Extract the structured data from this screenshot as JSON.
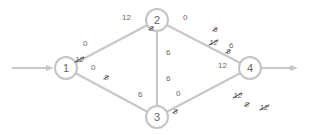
{
  "diagram": {
    "type": "flow-network",
    "nodes": [
      {
        "id": "1",
        "label": "1",
        "x": 66,
        "y": 68
      },
      {
        "id": "2",
        "label": "2",
        "x": 157,
        "y": 20
      },
      {
        "id": "3",
        "label": "3",
        "x": 157,
        "y": 117
      },
      {
        "id": "4",
        "label": "4",
        "x": 250,
        "y": 68
      }
    ],
    "source_arrow": {
      "into": "1"
    },
    "sink_arrow": {
      "from": "4"
    },
    "edges": [
      {
        "from": "1",
        "to": "2"
      },
      {
        "from": "1",
        "to": "3"
      },
      {
        "from": "2",
        "to": "3"
      },
      {
        "from": "2",
        "to": "4"
      },
      {
        "from": "3",
        "to": "4"
      }
    ],
    "labels": {
      "e12_near1_top": "0",
      "e12_near1_struck": "12",
      "e12_near2_value": "12",
      "e12_near2_struck": "8",
      "e13_near1_struck": "8",
      "e13_near1_value": "0",
      "e13_near3_value": "6",
      "e13_near3_struck": "8",
      "e24_near2_struck": "6",
      "e24_near2_value": "0",
      "e23_near2_struck1": "12",
      "e23_near2_struck2": "8",
      "e23_near2_value": "6",
      "e23_near3_value": "6",
      "e23_near3_struck1": "12",
      "e23_near3_struck2": "8",
      "e34_near3_struck": "12",
      "e34_near3_value": "0",
      "e24_near4_value": "6",
      "e24_near4_struck": "8",
      "e34_near4_value": "12",
      "e34_near4_struck": "8"
    }
  }
}
